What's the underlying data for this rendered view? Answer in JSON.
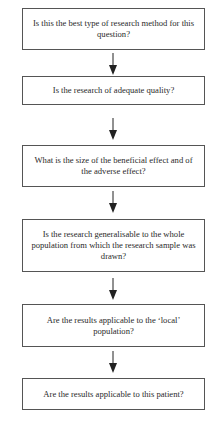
{
  "flowchart": {
    "steps": [
      {
        "text": "Is this the best type of research method for this question?"
      },
      {
        "text": "Is the research of adequate quality?"
      },
      {
        "text": "What is the size of the beneficial effect and of the adverse effect?"
      },
      {
        "text": "Is the research generalisable to the whole population from which the research sample was drawn?"
      },
      {
        "text": "Are the results applicable to the ‘local’ population?"
      },
      {
        "text": "Are the results applicable to this patient?"
      }
    ],
    "connectors": [
      "arrow-down",
      "arrow-down",
      "arrow-down",
      "arrow-down",
      "arrow-down"
    ]
  }
}
